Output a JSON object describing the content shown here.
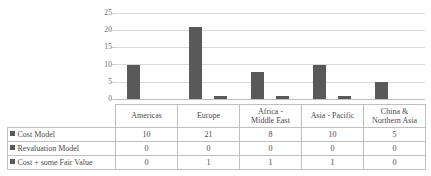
{
  "chart_data": {
    "type": "bar",
    "title": "",
    "xlabel": "",
    "ylabel": "",
    "ylim": [
      0,
      25
    ],
    "yticks": [
      0,
      5,
      10,
      15,
      20,
      25
    ],
    "grid": true,
    "legend_position": "data-table-left",
    "categories": [
      "Americas",
      "Europe",
      "Africa - Middle East",
      "Asia - Pacific",
      "China & Northern Asia"
    ],
    "series": [
      {
        "name": "Cost Model",
        "values": [
          10,
          21,
          8,
          10,
          5
        ],
        "color": "#595959"
      },
      {
        "name": "Revaluation Model",
        "values": [
          0,
          0,
          0,
          0,
          0
        ],
        "color": "#595959"
      },
      {
        "name": "Cost + some Fair Value",
        "values": [
          0,
          1,
          1,
          1,
          0
        ],
        "color": "#595959"
      }
    ]
  },
  "axis": {
    "ticks": [
      {
        "label": "25",
        "value": 25
      },
      {
        "label": "20",
        "value": 20
      },
      {
        "label": "15",
        "value": 15
      },
      {
        "label": "10",
        "value": 10
      },
      {
        "label": "5",
        "value": 5
      },
      {
        "label": "0",
        "value": 0
      }
    ]
  },
  "table": {
    "header": [
      "",
      "Americas",
      "Europe",
      "Africa - Middle East",
      "Asia - Pacific",
      "China & Northern Asia"
    ],
    "header_lines": [
      [
        ""
      ],
      [
        "Americas"
      ],
      [
        "Europe"
      ],
      [
        "Africa -",
        "Middle East"
      ],
      [
        "Asia - Pacific"
      ],
      [
        "China &",
        "Northern Asia"
      ]
    ],
    "rows": [
      {
        "label": "Cost Model",
        "values": [
          "10",
          "21",
          "8",
          "10",
          "5"
        ]
      },
      {
        "label": "Revaluation Model",
        "values": [
          "0",
          "0",
          "0",
          "0",
          "0"
        ]
      },
      {
        "label": "Cost + some Fair Value",
        "values": [
          "0",
          "1",
          "1",
          "1",
          "0"
        ]
      }
    ]
  },
  "colors": {
    "bar": "#595959",
    "grid": "#d9d9d9",
    "border": "#bfbfbf",
    "text": "#4a4a4a"
  }
}
